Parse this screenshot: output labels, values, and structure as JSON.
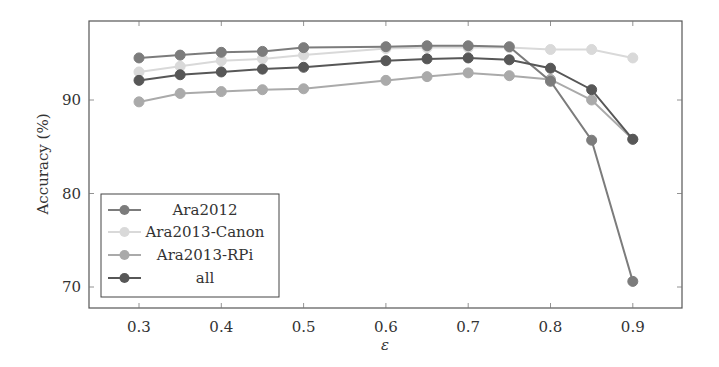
{
  "chart_data": {
    "type": "line",
    "title": "",
    "xlabel": "ε",
    "ylabel": "Accuracy (%)",
    "xlim": [
      0.24,
      0.96
    ],
    "ylim": [
      68,
      97.6
    ],
    "xticks": [
      0.3,
      0.4,
      0.5,
      0.6,
      0.7,
      0.8,
      0.9
    ],
    "xtick_labels": [
      "0.3",
      "0.4",
      "0.5",
      "0.6",
      "0.7",
      "0.8",
      "0.9"
    ],
    "yticks": [
      70,
      80,
      90
    ],
    "ytick_labels": [
      "70",
      "80",
      "90"
    ],
    "grid": false,
    "legend_position": "lower left",
    "x": [
      0.3,
      0.35,
      0.4,
      0.45,
      0.5,
      0.6,
      0.65,
      0.7,
      0.75,
      0.8,
      0.85,
      0.9
    ],
    "series": [
      {
        "name": "Ara2012",
        "color": "#7c7c7c",
        "values": [
          94.5,
          94.8,
          95.1,
          95.2,
          95.6,
          95.7,
          95.8,
          95.8,
          95.7,
          92.0,
          85.7,
          70.6
        ]
      },
      {
        "name": "Ara2013-Canon",
        "color": "#d9d9d9",
        "values": [
          93.0,
          93.6,
          94.2,
          94.4,
          94.8,
          95.5,
          95.6,
          95.6,
          95.6,
          95.4,
          95.4,
          94.5
        ]
      },
      {
        "name": "Ara2013-RPi",
        "color": "#aaaaaa",
        "values": [
          89.8,
          90.7,
          90.9,
          91.1,
          91.2,
          92.1,
          92.5,
          92.9,
          92.6,
          92.2,
          90.0,
          85.8
        ]
      },
      {
        "name": "all",
        "color": "#575757",
        "values": [
          92.1,
          92.7,
          93.0,
          93.3,
          93.5,
          94.2,
          94.4,
          94.5,
          94.3,
          93.4,
          91.1,
          85.8
        ]
      }
    ]
  }
}
